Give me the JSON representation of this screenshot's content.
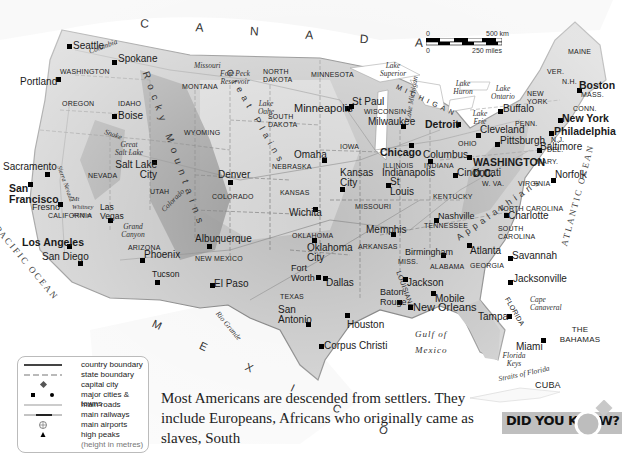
{
  "map": {
    "title": "United States physical/political map",
    "colors": {
      "land": "#b9b9b9",
      "land_light": "#d0d0d0",
      "mountain": "#8a8a8a",
      "water": "#ffffff",
      "boundary": "#555555"
    },
    "countries": [
      {
        "label": "C A N A D A"
      },
      {
        "label": "M E X I C O"
      },
      {
        "label": "CUBA"
      },
      {
        "label": "THE BAHAMAS"
      }
    ],
    "oceans": [
      {
        "label": "PACIFIC OCEAN"
      },
      {
        "label": "ATLANTIC OCEAN"
      },
      {
        "label": "Gulf of"
      },
      {
        "label": "Mexico"
      },
      {
        "label": "Straits of Florida"
      }
    ],
    "mountains": [
      {
        "label": "Rocky Mountains"
      },
      {
        "label": "Appalachians"
      },
      {
        "label": "Great Plains"
      }
    ],
    "states": [
      "WASHINGTON",
      "OREGON",
      "IDAHO",
      "MONTANA",
      "WYOMING",
      "NEVADA",
      "UTAH",
      "CALIFORNIA",
      "ARIZONA",
      "COLORADO",
      "NEW MEXICO",
      "NORTH DAKOTA",
      "SOUTH DAKOTA",
      "NEBRASKA",
      "KANSAS",
      "OKLAHOMA",
      "TEXAS",
      "MINNESOTA",
      "IOWA",
      "MISSOURI",
      "ARKANSAS",
      "LOUISIANA",
      "WISCONSIN",
      "ILLINOIS",
      "INDIANA",
      "MICHIGAN",
      "OHIO",
      "KENTUCKY",
      "TENNESSEE",
      "MISS.",
      "ALABAMA",
      "GEORGIA",
      "FLORIDA",
      "SOUTH CAROLINA",
      "NORTH CAROLINA",
      "VIRGINIA",
      "W. VA.",
      "PENN.",
      "NEW YORK",
      "MAINE",
      "VER.",
      "N.H.",
      "MASS.",
      "CONN.",
      "N.J.",
      "DEL.",
      "MARY."
    ],
    "cities": [
      {
        "name": "Seattle"
      },
      {
        "name": "Spokane"
      },
      {
        "name": "Portland"
      },
      {
        "name": "Boise"
      },
      {
        "name": "Sacramento"
      },
      {
        "name": "San Francisco"
      },
      {
        "name": "Fresno"
      },
      {
        "name": "Los Angeles"
      },
      {
        "name": "San Diego"
      },
      {
        "name": "Las Vegas"
      },
      {
        "name": "Salt Lake City"
      },
      {
        "name": "Phoenix"
      },
      {
        "name": "Tucson"
      },
      {
        "name": "Albuquerque"
      },
      {
        "name": "El Paso"
      },
      {
        "name": "Denver"
      },
      {
        "name": "Omaha"
      },
      {
        "name": "Kansas City"
      },
      {
        "name": "Wichita"
      },
      {
        "name": "Oklahoma City"
      },
      {
        "name": "Fort Worth"
      },
      {
        "name": "Dallas"
      },
      {
        "name": "San Antonio"
      },
      {
        "name": "Houston"
      },
      {
        "name": "Corpus Christi"
      },
      {
        "name": "Minneapolis"
      },
      {
        "name": "St Paul"
      },
      {
        "name": "Milwaukee"
      },
      {
        "name": "Chicago"
      },
      {
        "name": "Detroit"
      },
      {
        "name": "St Louis"
      },
      {
        "name": "Indianapolis"
      },
      {
        "name": "Columbus"
      },
      {
        "name": "Cincinnati"
      },
      {
        "name": "Cleveland"
      },
      {
        "name": "Pittsburgh"
      },
      {
        "name": "Buffalo"
      },
      {
        "name": "Memphis"
      },
      {
        "name": "Nashville"
      },
      {
        "name": "Birmingham"
      },
      {
        "name": "Jackson"
      },
      {
        "name": "Baton Rouge"
      },
      {
        "name": "New Orleans"
      },
      {
        "name": "Mobile"
      },
      {
        "name": "Atlanta"
      },
      {
        "name": "Charlotte"
      },
      {
        "name": "Savannah"
      },
      {
        "name": "Jacksonville"
      },
      {
        "name": "Tampa"
      },
      {
        "name": "Miami"
      },
      {
        "name": "Norfolk"
      },
      {
        "name": "WASHINGTON D.C."
      },
      {
        "name": "Baltimore"
      },
      {
        "name": "Philadelphia"
      },
      {
        "name": "New York"
      },
      {
        "name": "Boston"
      }
    ],
    "features": [
      "Lake Superior",
      "Lake Michigan",
      "Lake Huron",
      "Lake Erie",
      "Lake Ontario",
      "Great Salt Lake",
      "Lake Oahe",
      "Fort Peck Reservoir",
      "Grand Canyon",
      "Mt Whitney 4418 m",
      "Sierra Nevada",
      "Cape Canaveral",
      "Florida Keys",
      "Columbia",
      "Snake",
      "Missouri",
      "Mississippi",
      "Colorado",
      "Rio Grande",
      "Hudson",
      "Tennessee"
    ]
  },
  "scale": {
    "km_zero": "0",
    "km_label": "500 km",
    "mi_zero": "0",
    "mi_label": "250 miles"
  },
  "legend": {
    "items": [
      {
        "label": "country boundary",
        "icon": "solid-line"
      },
      {
        "label": "state boundary",
        "icon": "dashed-line"
      },
      {
        "label": "capital city",
        "icon": "diamond"
      },
      {
        "label": "major cities & towns",
        "icon": "square-and-dot"
      },
      {
        "label": "main roads",
        "icon": "thin-line"
      },
      {
        "label": "main railways",
        "icon": "rail-line"
      },
      {
        "label": "main airports",
        "icon": "airport-circle"
      },
      {
        "label": "high peaks",
        "icon": "triangle"
      },
      {
        "label": "(height in metres)",
        "icon": ""
      }
    ]
  },
  "body": {
    "text": "Most Americans are descended from settlers. They include Europeans, Africans who originally came as slaves, South"
  },
  "did_you_know": {
    "label": "DID YOU KNOW?"
  }
}
